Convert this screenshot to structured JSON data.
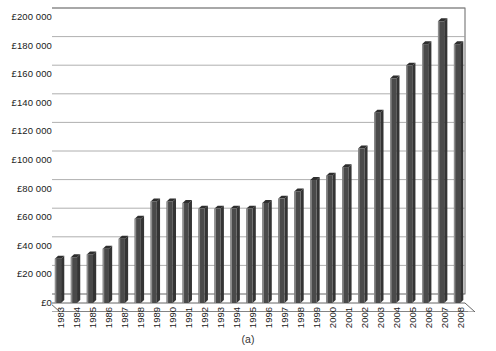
{
  "figure": {
    "caption": "(a)",
    "currency_symbol": "£"
  },
  "chart_data": {
    "type": "bar",
    "title": "",
    "subtitle": "",
    "xlabel": "",
    "ylabel": "",
    "categories": [
      "1983",
      "1984",
      "1985",
      "1986",
      "1987",
      "1988",
      "1989",
      "1990",
      "1991",
      "1992",
      "1993",
      "1994",
      "1995",
      "1996",
      "1997",
      "1998",
      "1999",
      "2000",
      "2001",
      "2002",
      "2003",
      "2004",
      "2005",
      "2006",
      "2007",
      "2008"
    ],
    "values": [
      31000,
      32000,
      34000,
      38000,
      45000,
      59000,
      71000,
      71000,
      70000,
      66000,
      66000,
      66000,
      66000,
      70000,
      73000,
      78000,
      86000,
      89000,
      95000,
      108000,
      133000,
      157000,
      166000,
      181000,
      197000,
      181000
    ],
    "series": [
      {
        "name": "Average house price",
        "values": [
          31000,
          32000,
          34000,
          38000,
          45000,
          59000,
          71000,
          71000,
          70000,
          66000,
          66000,
          66000,
          66000,
          70000,
          73000,
          78000,
          86000,
          89000,
          95000,
          108000,
          133000,
          157000,
          166000,
          181000,
          197000,
          181000
        ]
      }
    ],
    "ylim": [
      0,
      200000
    ],
    "ytick_values": [
      0,
      20000,
      40000,
      60000,
      80000,
      100000,
      120000,
      140000,
      160000,
      180000,
      200000
    ],
    "ytick_labels": [
      "£0",
      "£20 000",
      "£40 000",
      "£60 000",
      "£80 000",
      "£100 000",
      "£120 000",
      "£140 000",
      "£160 000",
      "£180 000",
      "£200 000"
    ],
    "grid": true,
    "grid_axis": "y",
    "legend": false,
    "legend_position": "none",
    "style_3d": true,
    "bar_color": "#4a4a4a",
    "bar_highlight_color": "#8e8e8e",
    "bar_top_color": "#2e2e2e",
    "grid_color": "#9a9a9a",
    "axis_color": "#555555",
    "plot_background": "#ffffff",
    "annotations": []
  }
}
